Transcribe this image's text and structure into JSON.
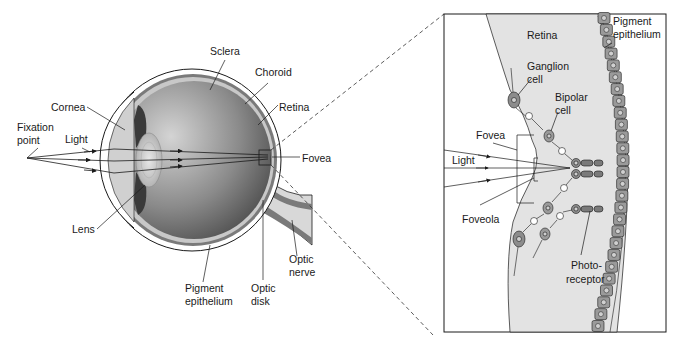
{
  "diagram": {
    "eye_labels": {
      "sclera": "Sclera",
      "choroid": "Choroid",
      "retina": "Retina",
      "cornea": "Cornea",
      "fixation_point_1": "Fixation",
      "fixation_point_2": "point",
      "light": "Light",
      "fovea": "Fovea",
      "lens": "Lens",
      "pigment_epithelium_1": "Pigment",
      "pigment_epithelium_2": "epithelium",
      "optic_disk_1": "Optic",
      "optic_disk_2": "disk",
      "optic_nerve_1": "Optic",
      "optic_nerve_2": "nerve"
    },
    "inset_labels": {
      "retina": "Retina",
      "pigment_epithelium_1": "Pigment",
      "pigment_epithelium_2": "epithelium",
      "ganglion_cell_1": "Ganglion",
      "ganglion_cell_2": "cell",
      "bipolar_cell_1": "Bipolar",
      "bipolar_cell_2": "cell",
      "fovea": "Fovea",
      "light": "Light",
      "foveola": "Foveola",
      "photoreceptor_1": "Photo-",
      "photoreceptor_2": "receptor"
    },
    "colors": {
      "line": "#1a1a1a",
      "sclera_fill": "#ffffff",
      "choroid_fill": "#7a7a7a",
      "retina_fill": "#c8c8c8",
      "vitreous_dark": "#5a5a5a",
      "vitreous_light": "#cfcfcf",
      "cell_fill": "#8c8c8c",
      "inset_bg": "#e6e6e6"
    }
  }
}
